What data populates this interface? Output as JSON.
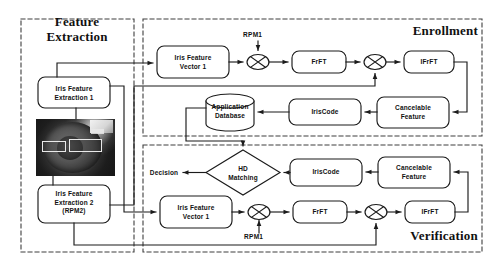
{
  "figure": {
    "type": "block-diagram"
  },
  "panels": {
    "feature_extraction": {
      "title": "Feature\nExtraction"
    },
    "enrollment": {
      "title": "Enrollment"
    },
    "verification": {
      "title": "Verification"
    }
  },
  "feature_extraction": {
    "nodes": [
      {
        "id": "ife1",
        "label": "Iris Feature\nExtraction 1",
        "shape": "rounded-rect"
      },
      {
        "id": "iris_image",
        "label": "iris-eye-image",
        "shape": "image"
      },
      {
        "id": "ife2",
        "label": "Iris Feature\nExtraction 2\n(RPM2)",
        "shape": "rounded-rect"
      }
    ],
    "roi_boxes": 2
  },
  "enrollment": {
    "nodes": [
      {
        "id": "e_ifv1",
        "label": "Iris Feature\nVector 1",
        "shape": "rounded-rect"
      },
      {
        "id": "e_mul1",
        "label": "multiply-operator",
        "shape": "circle-times"
      },
      {
        "id": "e_frft",
        "label": "FrFT",
        "shape": "rounded-rect"
      },
      {
        "id": "e_mul2",
        "label": "multiply-operator",
        "shape": "circle-times"
      },
      {
        "id": "e_ifrft",
        "label": "IFrFT",
        "shape": "rounded-rect"
      },
      {
        "id": "e_cancelable",
        "label": "Cancelable\nFeature",
        "shape": "rounded-rect"
      },
      {
        "id": "e_iriscode",
        "label": "IrisCode",
        "shape": "rounded-rect"
      },
      {
        "id": "e_db",
        "label": "Application\nDatabase",
        "shape": "cylinder"
      }
    ],
    "inputs": [
      {
        "id": "e_rpm1",
        "label": "RPM1"
      }
    ]
  },
  "verification": {
    "nodes": [
      {
        "id": "v_ifv1",
        "label": "Iris Feature\nVector 1",
        "shape": "rounded-rect"
      },
      {
        "id": "v_mul1",
        "label": "multiply-operator",
        "shape": "circle-times"
      },
      {
        "id": "v_frft",
        "label": "FrFT",
        "shape": "rounded-rect"
      },
      {
        "id": "v_mul2",
        "label": "multiply-operator",
        "shape": "circle-times"
      },
      {
        "id": "v_ifrft",
        "label": "IFrFT",
        "shape": "rounded-rect"
      },
      {
        "id": "v_cancelable",
        "label": "Cancelable\nFeature",
        "shape": "rounded-rect"
      },
      {
        "id": "v_iriscode",
        "label": "IrisCode",
        "shape": "rounded-rect"
      },
      {
        "id": "v_hd",
        "label": "HD\nMatching",
        "shape": "diamond"
      },
      {
        "id": "v_decision",
        "label": "Decision",
        "shape": "text"
      }
    ],
    "inputs": [
      {
        "id": "v_rpm1",
        "label": "RPM1"
      }
    ]
  },
  "colors": {
    "stroke": "#1b1b1b",
    "panel_border": "#4a4a4a",
    "text": "#111111",
    "background": "#ffffff"
  }
}
